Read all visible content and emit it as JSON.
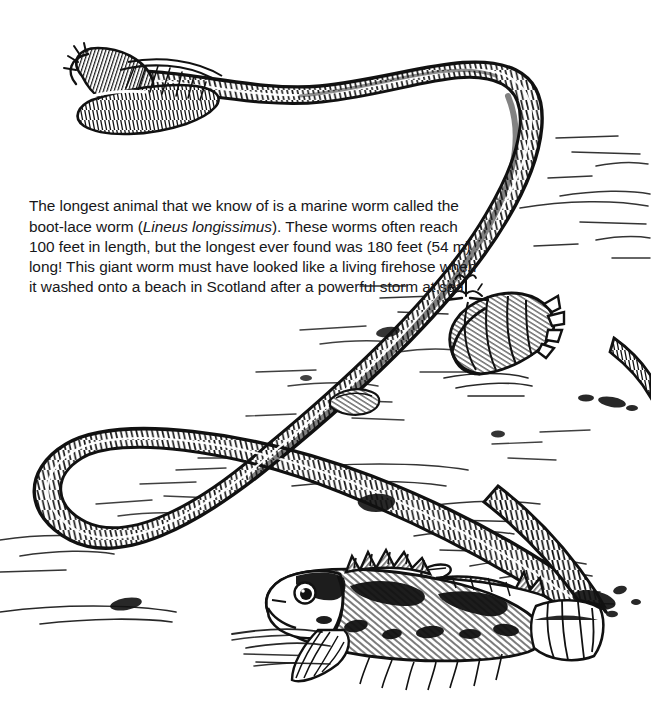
{
  "page": {
    "background_color": "#ffffff",
    "ink_color": "#111111",
    "width": 651,
    "height": 706,
    "medium": "black-and-white pen-and-ink line illustration"
  },
  "caption": {
    "full_text": "The longest animal that we know of is a marine worm called the boot-lace worm (Lineus longissimus). These worms often reach 100 feet in length, but the longest ever found was 180 feet (54 m) long! This giant worm must have looked like a living firehose when it washed onto a beach in Scotland after a powerful storm at sea.",
    "lines": [
      "The longest animal that we know of is a marine worm called",
      "the boot-lace worm (Lineus longissimus). These worms often",
      "reach 100 feet in length, but the longest ever found was",
      "180 feet (54 m) long! This giant worm must have looked",
      "like a living firehose when it washed onto a beach in",
      "Scotland after a powerful storm at sea."
    ],
    "segments": [
      {
        "text": "The longest animal that we know of is a marine worm called the boot-lace worm (",
        "style": "normal"
      },
      {
        "text": "Lineus longissimus",
        "style": "italic"
      },
      {
        "text": "). These worms often reach 100 feet in length, but the longest ever found was 180 feet (54 m) long! This giant worm must have looked like a living firehose when it washed onto a beach in Scotland after a powerful storm at sea.",
        "style": "normal"
      }
    ],
    "facts": {
      "common_name": "boot-lace worm",
      "scientific_name": "Lineus longissimus",
      "typical_length_feet": 100,
      "record_length_feet": 180,
      "record_length_meters": 54,
      "location": "Scotland",
      "habitat": "marine"
    }
  },
  "scene": {
    "subjects": [
      {
        "name": "boot-lace-worm",
        "description": "extremely long ribbon-like marine worm looping across the beach",
        "label": "Lineus longissimus"
      },
      {
        "name": "worm-head",
        "description": "flattened rounded head with fine hatching at upper left"
      },
      {
        "name": "worm-tail",
        "description": "tail end burying into wet sand at lower right"
      },
      {
        "name": "conch-shell",
        "description": "whelk shell with spiral ridges and pointed spire"
      },
      {
        "name": "sculpin-fish",
        "description": "mottled spiny fish lying on the sand"
      },
      {
        "name": "seaweed-sprig",
        "description": "small tuft of seaweed near the shell"
      },
      {
        "name": "pebbles",
        "description": "scattered pebbles and shell fragments"
      },
      {
        "name": "sand-texture",
        "description": "horizontal stroke hatching suggesting wet sand"
      }
    ]
  }
}
